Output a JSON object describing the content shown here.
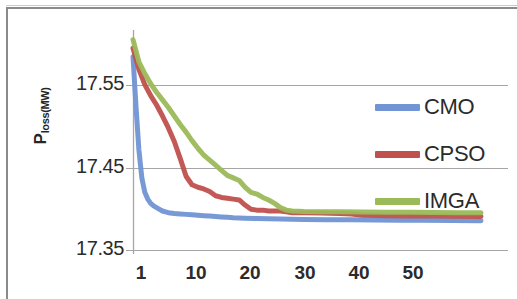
{
  "chart_data": {
    "type": "line",
    "title": "",
    "xlabel": "",
    "ylabel": "Ploss(MW)",
    "ylabel_base": "P",
    "ylabel_sub": "loss(MW)",
    "xlim": [
      1,
      60
    ],
    "ylim": [
      17.35,
      17.6
    ],
    "grid": true,
    "grid_axis": "y",
    "legend_position": "right",
    "y_ticks": [
      "17.35",
      "17.45",
      "17.55"
    ],
    "y_tick_values": [
      17.35,
      17.45,
      17.55
    ],
    "x_ticks": [
      "1",
      "10",
      "20",
      "30",
      "40",
      "50"
    ],
    "x_tick_values": [
      1,
      10,
      20,
      30,
      40,
      50
    ],
    "colors": {
      "CMO": "#7094d4",
      "CPSO": "#c0504d",
      "IMGA": "#9bbb59",
      "gridline": "#a6a6a6",
      "axis": "#a6a6a6",
      "frame": "#8a8a8a",
      "text": "#2b2b2b",
      "background": "#ffffff"
    },
    "series": [
      {
        "name": "CMO",
        "color": "#7094d4",
        "x": [
          1,
          1.5,
          2,
          2.5,
          3,
          3.5,
          4,
          4.5,
          5,
          5.5,
          6,
          6.5,
          7,
          8,
          9,
          10,
          11,
          12,
          13,
          14,
          15,
          16,
          17,
          18,
          19,
          20,
          22,
          24,
          26,
          28,
          30,
          34,
          38,
          42,
          46,
          50,
          55,
          60
        ],
        "values": [
          17.578,
          17.52,
          17.468,
          17.435,
          17.418,
          17.41,
          17.405,
          17.402,
          17.4,
          17.398,
          17.396,
          17.395,
          17.394,
          17.393,
          17.3925,
          17.392,
          17.3915,
          17.391,
          17.3905,
          17.39,
          17.3895,
          17.389,
          17.3885,
          17.388,
          17.3878,
          17.3875,
          17.387,
          17.3868,
          17.3865,
          17.3863,
          17.386,
          17.3858,
          17.3856,
          17.3854,
          17.3852,
          17.385,
          17.3848,
          17.3846
        ]
      },
      {
        "name": "CPSO",
        "color": "#c0504d",
        "x": [
          1,
          2,
          3,
          4,
          5,
          6,
          7,
          8,
          9,
          10,
          11,
          12,
          13,
          14,
          15,
          16,
          17,
          18,
          19,
          20,
          21,
          22,
          23,
          24,
          25,
          26,
          27,
          28,
          30,
          33,
          36,
          38,
          40,
          44,
          48,
          52,
          56,
          60
        ],
        "values": [
          17.588,
          17.563,
          17.545,
          17.532,
          17.521,
          17.508,
          17.494,
          17.478,
          17.458,
          17.437,
          17.427,
          17.424,
          17.422,
          17.419,
          17.414,
          17.412,
          17.411,
          17.41,
          17.409,
          17.403,
          17.398,
          17.397,
          17.397,
          17.396,
          17.396,
          17.396,
          17.395,
          17.394,
          17.394,
          17.3935,
          17.393,
          17.3925,
          17.391,
          17.3905,
          17.3902,
          17.39,
          17.3898,
          17.3896
        ]
      },
      {
        "name": "IMGA",
        "color": "#9bbb59",
        "x": [
          1,
          2,
          3,
          4,
          5,
          6,
          7,
          8,
          9,
          10,
          11,
          12,
          13,
          14,
          15,
          16,
          17,
          18,
          19,
          20,
          21,
          22,
          23,
          24,
          25,
          26,
          27,
          28,
          30,
          33,
          36,
          40,
          44,
          48,
          52,
          56,
          60
        ],
        "values": [
          17.598,
          17.572,
          17.558,
          17.546,
          17.536,
          17.527,
          17.518,
          17.508,
          17.498,
          17.489,
          17.479,
          17.47,
          17.462,
          17.456,
          17.45,
          17.444,
          17.438,
          17.435,
          17.432,
          17.424,
          17.418,
          17.416,
          17.412,
          17.409,
          17.405,
          17.4,
          17.397,
          17.396,
          17.3955,
          17.3952,
          17.395,
          17.3948,
          17.3946,
          17.3944,
          17.3942,
          17.394,
          17.3938
        ]
      }
    ],
    "legend": [
      {
        "label": "CMO",
        "color": "#7094d4"
      },
      {
        "label": "CPSO",
        "color": "#c0504d"
      },
      {
        "label": "IMGA",
        "color": "#9bbb59"
      }
    ]
  },
  "layout": {
    "plot_left": 133,
    "plot_right": 481,
    "plot_top": 38,
    "plot_bottom": 250,
    "legend_positions": [
      {
        "left": 375,
        "top": 96
      },
      {
        "left": 375,
        "top": 143
      },
      {
        "left": 375,
        "top": 190
      }
    ],
    "y_tick_pixels": [
      250,
      168,
      85
    ],
    "x_tick_pixels": [
      141,
      196,
      250,
      305,
      359,
      413
    ]
  }
}
